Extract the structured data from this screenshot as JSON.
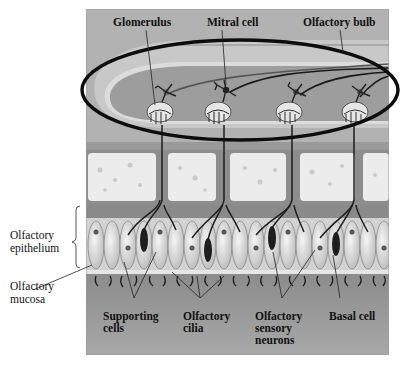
{
  "diagram": {
    "labels": {
      "glomerulus": "Glomerulus",
      "mitral_cell": "Mitral cell",
      "olfactory_bulb": "Olfactory bulb",
      "olfactory_epithelium": "Olfactory\nepithelium",
      "olfactory_mucosa": "Olfactory\nmucosa",
      "supporting_cells": "Supporting\ncells",
      "olfactory_cilia": "Olfactory\ncilia",
      "olfactory_sensory_neurons": "Olfactory\nsensory\nneurons",
      "basal_cell": "Basal cell"
    },
    "colors": {
      "background": "#ffffff",
      "panel": "#a9a9a9",
      "bulb_light": "#c4c4c4",
      "bulb_dark": "#9a9a9a",
      "bone": "#ececec",
      "membrane": "#7e7e7e",
      "epithelium": "#d9d9d9",
      "mucosa": "#9c9c9c",
      "highlight_ellipse": "#0d0d0d"
    }
  }
}
